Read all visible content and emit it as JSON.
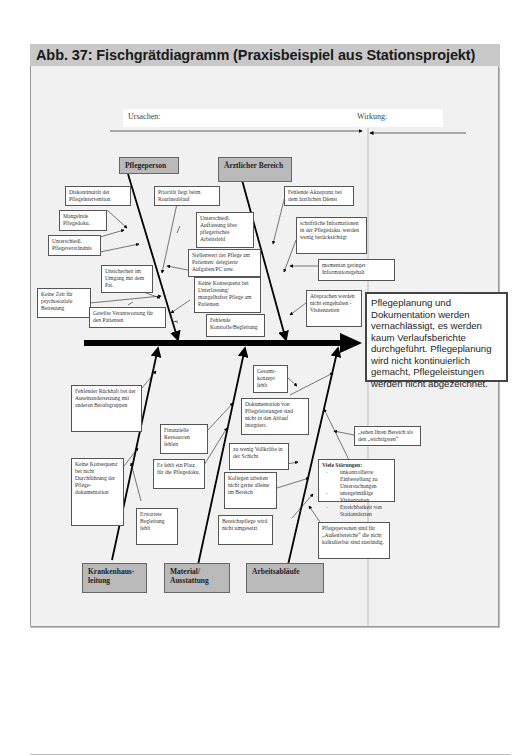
{
  "figure": {
    "title": "Abb. 37: Fischgrätdiagramm (Praxisbeispiel aus Stationsprojekt)",
    "legend": {
      "causes_label": "Ursachen:",
      "effect_label": "Wirkung:"
    }
  },
  "categories": {
    "pflegeperson": "Pflegeperson",
    "aerztlicher_bereich": "Ärztlicher Bereich",
    "krankenhausleitung": "Krankenhaus-leitung",
    "material": "Material/ Ausstattung",
    "arbeitsablaeufe": "Arbeitsabläufe"
  },
  "causes": {
    "pflegeperson": [
      "Diskontinuität der Pflegeintervention",
      "Mangelnde Pflegedoku.",
      "Unterschiedl. Pflegeverständnis",
      "Priorität liegt beim Routineablauf",
      "Unterschiedl. Auffassung über pflegerisches Arbeitsfeld",
      "Stellenwert der Pflege am Patienten/ delegierte Aufgaben/PC usw.",
      "Unsicherheit im Umgang mit dem Pat.",
      "Keine Konsequenz bei Unterlassung/ mangelhafter Pflege am Patienten",
      "Keine Zeit für psychosoziale Betreuung",
      "Geteilte Verantwortung für den Patienten",
      "Fehlende Kontrolle/Begleitung"
    ],
    "aerztlicher_bereich": [
      "Fehlende Akzeptanz bei dem ärztlichen Dienst",
      "schriftliche Informationen in der Pflegedoku. werden wenig berücksichtigt",
      "momentan geringer Informationsgehalt",
      "Absprachen werden nicht eingehalten -Visitenzeiten"
    ],
    "krankenhausleitung": [
      "Fehlender Rückhalt bei der Auseinandersetzung mit anderen Berufsgruppen",
      "Keine Konsequenz bei nicht Durchführung der Pflege-dokumentation",
      "Erwartete Begleitung fehlt"
    ],
    "material": [
      "Finanzielle Ressourcen fehlen",
      "Es fehlt ein Platz für die Pflegedoku."
    ],
    "arbeitsablaeufe": [
      "Gesamt-konzept fehlt",
      "Dokumentation von Pflegeleistungen sind nicht in den Ablauf integriert.",
      "zu wenig Vollkräfte in der Schicht",
      "Kollegen arbeiten nicht gerne alleine im Bereich",
      "Bereichspflege wird nicht umgesetzt",
      "„sehen Ihren Bereich als den „wichtigsten“",
      "Pflegepersonen sind für „Außenbereiche“ die nicht kalkulierbar sind zuständig."
    ],
    "stoerungen": {
      "title": "Viele Störungen:",
      "items": [
        "unkontrollierte Einbestellung zu Untersuchungen",
        "unregelmäßige Visitenzeiten",
        "Erreichbarkeit von Stationsärzten"
      ]
    }
  },
  "effect": {
    "text": "Pflegeplanung und Dokumentation werden vernachlässigt, es werden kaum Verlaufsberichte durchgeführt. Pflegeplanung wird nicht kontinuierlich gemacht, Pflegeleistungen werden nicht abgezeichnet."
  },
  "colors": {
    "panel_bg": "#f1f1f1",
    "title_bar_bg": "#c8c8c8",
    "category_bg": "#b9b9b9",
    "spine": "#000000"
  }
}
